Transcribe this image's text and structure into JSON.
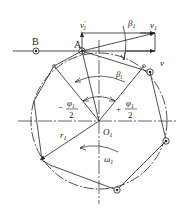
{
  "diagram": {
    "labels": {
      "point_b": "B",
      "point_a": "A",
      "velocity_v1_prime": "v",
      "velocity_v1_prime_sup": "'",
      "velocity_v1_prime_sub": "1",
      "velocity_v1": "v",
      "velocity_v1_sub": "1",
      "velocity_v": "v",
      "angle_beta1": "β",
      "angle_beta1_sub": "1",
      "angle_betai": "β",
      "angle_betai_sub": "i",
      "neg_phi_sign": "−",
      "neg_phi_num": "φ",
      "neg_phi_num_sub": "1",
      "neg_phi_den": "2",
      "pos_phi_sign": "+",
      "pos_phi_num": "φ",
      "pos_phi_num_sub": "1",
      "pos_phi_den": "2",
      "radius": "r",
      "radius_sub": "1",
      "center": "O",
      "center_sub": "1",
      "angular_velocity": "ω",
      "angular_velocity_sub": "1"
    },
    "colors": {
      "line": "#222222",
      "background": "#ffffff"
    }
  }
}
